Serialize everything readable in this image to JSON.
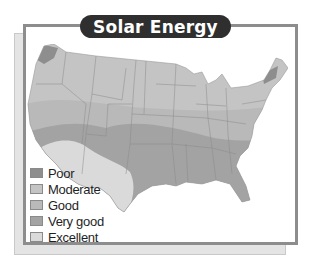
{
  "title": "Solar Energy",
  "legend": [
    {
      "key": "poor",
      "label": "Poor",
      "color": "#8e8e8e"
    },
    {
      "key": "moderate",
      "label": "Moderate",
      "color": "#c4c4c4"
    },
    {
      "key": "good",
      "label": "Good",
      "color": "#b9b9b9"
    },
    {
      "key": "very_good",
      "label": "Very good",
      "color": "#a3a3a3"
    },
    {
      "key": "excellent",
      "label": "Excellent",
      "color": "#dadada"
    }
  ],
  "map": {
    "subject": "United States (contiguous)",
    "regions": [
      {
        "name": "Pacific Northwest coast",
        "category": "poor"
      },
      {
        "name": "Northern New England",
        "category": "poor"
      },
      {
        "name": "Northern tier & Great Lakes",
        "category": "moderate"
      },
      {
        "name": "Central plains & Midwest",
        "category": "good"
      },
      {
        "name": "Southeast & southern plains band",
        "category": "very_good"
      },
      {
        "name": "Desert Southwest",
        "category": "excellent"
      }
    ]
  }
}
